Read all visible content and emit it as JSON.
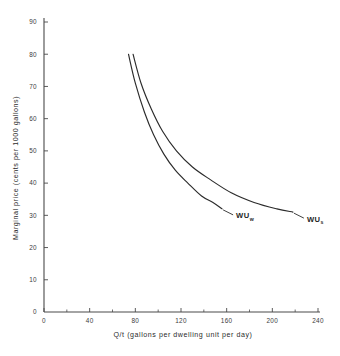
{
  "chart_data": {
    "type": "line",
    "title": "",
    "xlabel": "Q/t  (gallons per dwelling unit per day)",
    "ylabel": "Marginal price (cents per 1000 gallons)",
    "xlim": [
      0,
      240
    ],
    "ylim": [
      0,
      90
    ],
    "xticks": [
      0,
      40,
      80,
      120,
      160,
      200,
      240
    ],
    "xticklabels": [
      "0",
      "40",
      "80",
      "120",
      "160",
      "200",
      "240"
    ],
    "xminorticks": [
      20,
      60,
      100,
      140,
      180,
      220
    ],
    "yticks": [
      0,
      10,
      20,
      30,
      40,
      50,
      60,
      70,
      80,
      90
    ],
    "yticklabels": [
      "0",
      "10",
      "20",
      "30",
      "40",
      "50",
      "60",
      "70",
      "80",
      "90"
    ],
    "grid": false,
    "legend": "inline-curve-labels",
    "series": [
      {
        "name": "WUw",
        "label_text": "WU",
        "label_subscript": "w",
        "points": [
          {
            "x": 74,
            "y": 80
          },
          {
            "x": 80,
            "y": 71
          },
          {
            "x": 88,
            "y": 62
          },
          {
            "x": 96,
            "y": 55
          },
          {
            "x": 105,
            "y": 49
          },
          {
            "x": 115,
            "y": 44
          },
          {
            "x": 126,
            "y": 40
          },
          {
            "x": 138,
            "y": 36
          },
          {
            "x": 148,
            "y": 34
          },
          {
            "x": 156,
            "y": 32
          }
        ]
      },
      {
        "name": "WUs",
        "label_text": "WU",
        "label_subscript": "s",
        "points": [
          {
            "x": 78,
            "y": 80
          },
          {
            "x": 85,
            "y": 71
          },
          {
            "x": 94,
            "y": 63
          },
          {
            "x": 104,
            "y": 56
          },
          {
            "x": 116,
            "y": 50
          },
          {
            "x": 130,
            "y": 45
          },
          {
            "x": 146,
            "y": 41
          },
          {
            "x": 164,
            "y": 37
          },
          {
            "x": 184,
            "y": 34
          },
          {
            "x": 204,
            "y": 32
          },
          {
            "x": 218,
            "y": 31
          }
        ]
      }
    ],
    "annotations": [
      {
        "text": "WUw",
        "near_x": 156,
        "near_y": 32
      },
      {
        "text": "WUs",
        "near_x": 218,
        "near_y": 31
      }
    ]
  },
  "colors": {
    "background": "#ffffff",
    "axis": "#4a4a4a",
    "curve": "#2b2b2b",
    "text": "#2b2b2b"
  }
}
